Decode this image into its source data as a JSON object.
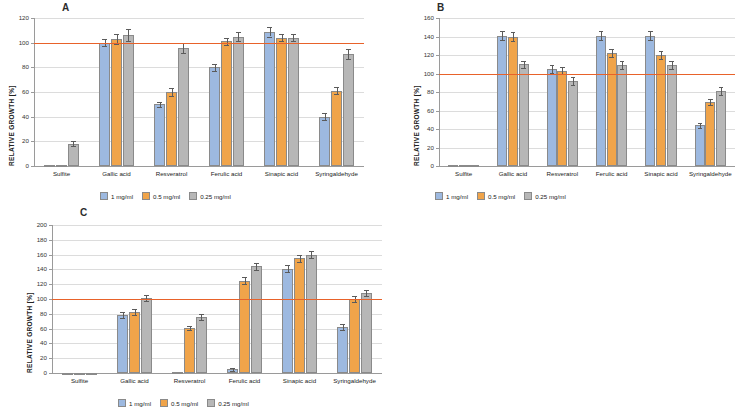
{
  "legend": {
    "items": [
      {
        "label": "1 mg/ml",
        "color": "#9DB9E0"
      },
      {
        "label": "0.5 mg/ml",
        "color": "#F0A44A"
      },
      {
        "label": "0.25 mg/ml",
        "color": "#B7B7B7"
      }
    ]
  },
  "reference_line_color": "#E8622A",
  "panels": [
    {
      "letter": "A"
    },
    {
      "letter": "B"
    },
    {
      "letter": "C"
    }
  ],
  "chart_data": [
    {
      "type": "bar",
      "title": "A",
      "xlabel": "",
      "ylabel": "RELATIVE GROWTH [%]",
      "ylim": [
        0,
        120
      ],
      "yticks": [
        0,
        20,
        40,
        60,
        80,
        100,
        120
      ],
      "grid": true,
      "reference_line": 100,
      "categories": [
        "Sulfite",
        "Gallic acid",
        "Resveratrol",
        "Ferulic acid",
        "Sinapic acid",
        "Syringaldehyde"
      ],
      "series": [
        {
          "name": "1 mg/ml",
          "color": "#9DB9E0",
          "values": [
            1,
            100,
            50,
            80,
            109,
            40
          ],
          "errors": [
            1,
            3,
            2,
            3,
            4,
            3
          ]
        },
        {
          "name": "0.5 mg/ml",
          "color": "#F0A44A",
          "values": [
            1,
            103,
            60,
            101,
            104,
            61
          ],
          "errors": [
            1,
            4,
            3,
            3,
            3,
            3
          ]
        },
        {
          "name": "0.25 mg/ml",
          "color": "#B7B7B7",
          "values": [
            18,
            106,
            96,
            105,
            104,
            91
          ],
          "errors": [
            2,
            5,
            4,
            4,
            3,
            4
          ]
        }
      ],
      "legend_position": "bottom"
    },
    {
      "type": "bar",
      "title": "B",
      "xlabel": "",
      "ylabel": "RELATIVE GROWTH [%]",
      "ylim": [
        0,
        160
      ],
      "yticks": [
        0,
        20,
        40,
        60,
        80,
        100,
        120,
        140,
        160
      ],
      "grid": true,
      "reference_line": 100,
      "categories": [
        "Sulfite",
        "Gallic acid",
        "Resveratrol",
        "Ferulic acid",
        "Sinapic acid",
        "Syringaldehyde"
      ],
      "series": [
        {
          "name": "1 mg/ml",
          "color": "#9DB9E0",
          "values": [
            1,
            141,
            105,
            141,
            141,
            44
          ],
          "errors": [
            1,
            5,
            4,
            5,
            5,
            3
          ]
        },
        {
          "name": "0.5 mg/ml",
          "color": "#F0A44A",
          "values": [
            1,
            140,
            103,
            122,
            120,
            69
          ],
          "errors": [
            1,
            5,
            4,
            4,
            4,
            3
          ]
        },
        {
          "name": "0.25 mg/ml",
          "color": "#B7B7B7",
          "values": [
            1,
            110,
            92,
            109,
            109,
            81
          ],
          "errors": [
            1,
            4,
            4,
            4,
            4,
            4
          ]
        }
      ],
      "legend_position": "bottom"
    },
    {
      "type": "bar",
      "title": "C",
      "xlabel": "",
      "ylabel": "RELATIVE GROWTH [%]",
      "ylim": [
        0,
        200
      ],
      "yticks": [
        0,
        20,
        40,
        60,
        80,
        100,
        120,
        140,
        160,
        180,
        200
      ],
      "grid": true,
      "reference_line": 100,
      "categories": [
        "Sulfite",
        "Gallic acid",
        "Resveratrol",
        "Ferulic acid",
        "Sinapic acid",
        "Syringaldehyde"
      ],
      "series": [
        {
          "name": "1 mg/ml",
          "color": "#9DB9E0",
          "values": [
            0,
            78,
            1,
            5,
            141,
            62
          ],
          "errors": [
            0,
            4,
            1,
            2,
            5,
            4
          ]
        },
        {
          "name": "0.5 mg/ml",
          "color": "#F0A44A",
          "values": [
            0,
            83,
            61,
            125,
            155,
            100
          ],
          "errors": [
            0,
            4,
            3,
            5,
            5,
            4
          ]
        },
        {
          "name": "0.25 mg/ml",
          "color": "#B7B7B7",
          "values": [
            0,
            101,
            76,
            144,
            160,
            108
          ],
          "errors": [
            0,
            4,
            4,
            5,
            5,
            4
          ]
        }
      ],
      "legend_position": "bottom"
    }
  ]
}
